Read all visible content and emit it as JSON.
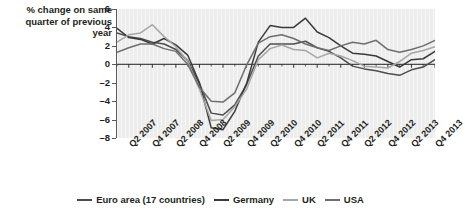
{
  "margin_text": "h",
  "axis_caption": "% change on same quarter of previous year",
  "legend": {
    "items": [
      {
        "label": "Euro area (17 countries)",
        "color": "#4d4d4d"
      },
      {
        "label": "Germany",
        "color": "#3a3a3a"
      },
      {
        "label": "UK",
        "color": "#a6a6a6"
      },
      {
        "label": "USA",
        "color": "#6e6e6e"
      }
    ]
  },
  "chart_data": {
    "type": "line",
    "title": "",
    "xlabel": "",
    "ylabel": "% change on same quarter of previous year",
    "ylim": [
      -8,
      6
    ],
    "yticks": [
      6,
      4,
      2,
      0,
      -2,
      -4,
      -6,
      -8
    ],
    "ytick_labels": [
      "6",
      "4",
      "2",
      "0",
      "–2",
      "–4",
      "–6",
      "–8"
    ],
    "grid": false,
    "legend_position": "bottom",
    "x": [
      "Q1 2007",
      "Q2 2007",
      "Q3 2007",
      "Q4 2007",
      "Q1 2008",
      "Q2 2008",
      "Q3 2008",
      "Q4 2008",
      "Q1 2009",
      "Q2 2009",
      "Q3 2009",
      "Q4 2009",
      "Q1 2010",
      "Q2 2010",
      "Q3 2010",
      "Q4 2010",
      "Q1 2011",
      "Q2 2011",
      "Q3 2011",
      "Q4 2011",
      "Q1 2012",
      "Q2 2012",
      "Q3 2012",
      "Q4 2012",
      "Q1 2013",
      "Q2 2013",
      "Q3 2013",
      "Q4 2013"
    ],
    "xtick_labels": [
      "Q2 2007",
      "Q4 2007",
      "Q2 2008",
      "Q4 2008",
      "Q2 2009",
      "Q4 2009",
      "Q2 2010",
      "Q4 2010",
      "Q2 2011",
      "Q4 2011",
      "Q2 2012",
      "Q4 2012",
      "Q2 2013",
      "Q4 2013"
    ],
    "xtick_indices": [
      1,
      3,
      5,
      7,
      9,
      11,
      13,
      15,
      17,
      19,
      21,
      23,
      25,
      27
    ],
    "series": [
      {
        "name": "Euro area (17 countries)",
        "color": "#4d4d4d",
        "values": [
          3.4,
          3.0,
          2.8,
          2.4,
          2.2,
          1.6,
          0.4,
          -2.1,
          -5.3,
          -5.5,
          -4.4,
          -2.2,
          0.9,
          2.2,
          2.2,
          2.2,
          2.5,
          1.8,
          1.4,
          0.7,
          -0.2,
          -0.5,
          -0.7,
          -1.0,
          -1.2,
          -0.6,
          -0.3,
          0.5
        ]
      },
      {
        "name": "Germany",
        "color": "#3a3a3a",
        "values": [
          3.9,
          2.9,
          2.7,
          2.2,
          2.8,
          2.1,
          1.0,
          -2.0,
          -6.9,
          -7.1,
          -5.1,
          -2.1,
          2.4,
          4.2,
          4.0,
          4.0,
          5.0,
          3.5,
          2.9,
          2.0,
          1.2,
          1.1,
          0.9,
          0.3,
          -0.3,
          0.5,
          0.6,
          1.4
        ]
      },
      {
        "name": "UK",
        "color": "#a6a6a6",
        "values": [
          2.4,
          3.2,
          3.4,
          4.3,
          3.0,
          1.9,
          0.3,
          -2.7,
          -6.1,
          -6.0,
          -4.6,
          -2.7,
          0.5,
          1.7,
          2.1,
          1.6,
          1.5,
          0.7,
          1.2,
          0.9,
          0.4,
          -0.2,
          -0.3,
          -0.4,
          0.3,
          1.2,
          1.5,
          1.9
        ]
      },
      {
        "name": "USA",
        "color": "#6e6e6e",
        "values": [
          1.3,
          1.8,
          2.2,
          2.2,
          1.7,
          1.4,
          0.0,
          -2.5,
          -4.0,
          -4.1,
          -3.1,
          -0.1,
          2.3,
          3.0,
          3.2,
          2.8,
          2.2,
          1.8,
          1.5,
          2.0,
          2.4,
          2.2,
          2.6,
          1.6,
          1.3,
          1.6,
          2.0,
          2.6
        ]
      }
    ]
  }
}
